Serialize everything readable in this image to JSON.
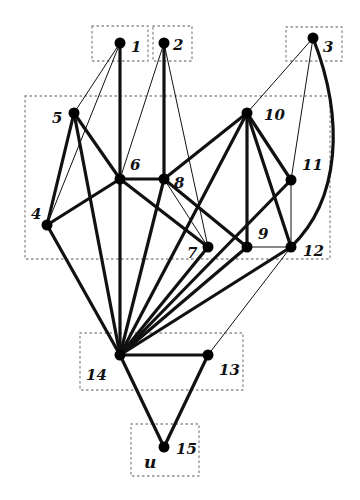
{
  "diagram": {
    "type": "graph",
    "colors": {
      "edge": "#111111",
      "node": "#000000",
      "box": "#8a8a8a",
      "background": "#ffffff"
    },
    "nodes": [
      {
        "id": "1",
        "label": "1",
        "x": 120,
        "y": 43,
        "lx": 131,
        "ly": 52
      },
      {
        "id": "2",
        "label": "2",
        "x": 164,
        "y": 43,
        "lx": 173,
        "ly": 50
      },
      {
        "id": "3",
        "label": "3",
        "x": 313,
        "y": 38,
        "lx": 323,
        "ly": 52
      },
      {
        "id": "4",
        "label": "4",
        "x": 47,
        "y": 225,
        "lx": 31,
        "ly": 219
      },
      {
        "id": "5",
        "label": "5",
        "x": 74,
        "y": 113,
        "lx": 52,
        "ly": 123
      },
      {
        "id": "6",
        "label": "6",
        "x": 120,
        "y": 179,
        "lx": 130,
        "ly": 170
      },
      {
        "id": "7",
        "label": "7",
        "x": 208,
        "y": 247,
        "lx": 187,
        "ly": 258
      },
      {
        "id": "8",
        "label": "8",
        "x": 164,
        "y": 179,
        "lx": 174,
        "ly": 188
      },
      {
        "id": "9",
        "label": "9",
        "x": 247,
        "y": 247,
        "lx": 258,
        "ly": 239
      },
      {
        "id": "10",
        "label": "10",
        "x": 247,
        "y": 113,
        "lx": 264,
        "ly": 120
      },
      {
        "id": "11",
        "label": "11",
        "x": 291,
        "y": 180,
        "lx": 302,
        "ly": 170
      },
      {
        "id": "12",
        "label": "12",
        "x": 291,
        "y": 247,
        "lx": 303,
        "ly": 256
      },
      {
        "id": "13",
        "label": "13",
        "x": 208,
        "y": 355,
        "lx": 219,
        "ly": 375
      },
      {
        "id": "14",
        "label": "14",
        "x": 120,
        "y": 355,
        "lx": 86,
        "ly": 380
      },
      {
        "id": "15",
        "label": "15",
        "x": 164,
        "y": 447,
        "lx": 176,
        "ly": 454
      }
    ],
    "extra_labels": [
      {
        "text": "u",
        "x": 144,
        "y": 468
      }
    ],
    "boxes": [
      {
        "name": "box-1",
        "x": 92,
        "y": 26,
        "w": 56,
        "h": 35
      },
      {
        "name": "box-2",
        "x": 153,
        "y": 26,
        "w": 39,
        "h": 35
      },
      {
        "name": "box-3",
        "x": 286,
        "y": 27,
        "w": 56,
        "h": 34
      },
      {
        "name": "box-mid",
        "x": 25,
        "y": 96,
        "w": 305,
        "h": 163
      },
      {
        "name": "box-14",
        "x": 80,
        "y": 333,
        "w": 163,
        "h": 57
      },
      {
        "name": "box-15",
        "x": 131,
        "y": 424,
        "w": 68,
        "h": 52
      }
    ],
    "edges": [
      {
        "from": "1",
        "to": "5",
        "weight": "thin"
      },
      {
        "from": "1",
        "to": "4",
        "weight": "thin"
      },
      {
        "from": "1",
        "to": "6",
        "weight": "thick"
      },
      {
        "from": "2",
        "to": "6",
        "weight": "thin"
      },
      {
        "from": "2",
        "to": "8",
        "weight": "thick"
      },
      {
        "from": "2",
        "to": "7",
        "weight": "thin"
      },
      {
        "from": "3",
        "to": "10",
        "weight": "thin"
      },
      {
        "from": "3",
        "to": "11",
        "weight": "thin"
      },
      {
        "from": "5",
        "to": "4",
        "weight": "thick"
      },
      {
        "from": "5",
        "to": "6",
        "weight": "thick"
      },
      {
        "from": "5",
        "to": "14",
        "weight": "thick"
      },
      {
        "from": "4",
        "to": "6",
        "weight": "thick"
      },
      {
        "from": "4",
        "to": "14",
        "weight": "thick"
      },
      {
        "from": "6",
        "to": "8",
        "weight": "thick"
      },
      {
        "from": "6",
        "to": "7",
        "weight": "thick"
      },
      {
        "from": "6",
        "to": "14",
        "weight": "thick"
      },
      {
        "from": "8",
        "to": "7",
        "weight": "thin"
      },
      {
        "from": "8",
        "to": "9",
        "weight": "thick"
      },
      {
        "from": "8",
        "to": "10",
        "weight": "thick"
      },
      {
        "from": "8",
        "to": "14",
        "weight": "thick"
      },
      {
        "from": "10",
        "to": "9",
        "weight": "thick"
      },
      {
        "from": "10",
        "to": "11",
        "weight": "thick"
      },
      {
        "from": "10",
        "to": "12",
        "weight": "thick"
      },
      {
        "from": "10",
        "to": "14",
        "weight": "thick"
      },
      {
        "from": "11",
        "to": "12",
        "weight": "thin"
      },
      {
        "from": "11",
        "to": "14",
        "weight": "thick"
      },
      {
        "from": "9",
        "to": "12",
        "weight": "thin"
      },
      {
        "from": "9",
        "to": "14",
        "weight": "thick"
      },
      {
        "from": "7",
        "to": "14",
        "weight": "thick"
      },
      {
        "from": "12",
        "to": "14",
        "weight": "thick"
      },
      {
        "from": "12",
        "to": "13",
        "weight": "thin"
      },
      {
        "from": "14",
        "to": "13",
        "weight": "thick"
      },
      {
        "from": "14",
        "to": "15",
        "weight": "thick"
      },
      {
        "from": "13",
        "to": "15",
        "weight": "thick"
      }
    ],
    "curved_edges": [
      {
        "from": "3",
        "to": "12",
        "weight": "thick",
        "path": "M313,38 C345,120 340,200 291,247"
      }
    ]
  }
}
